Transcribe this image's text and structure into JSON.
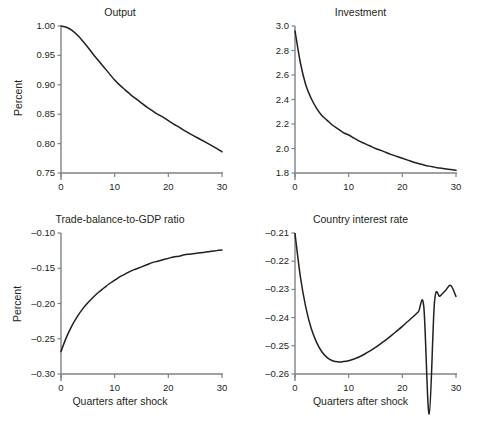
{
  "figure": {
    "background": "#ffffff",
    "axis_color": "#808285",
    "curve_color": "#231f20",
    "text_color": "#231f20"
  },
  "chart_data": [
    {
      "type": "line",
      "panel": "top-left",
      "title": "Output",
      "xlabel": "",
      "ylabel": "Percent",
      "xlim": [
        0,
        30
      ],
      "ylim": [
        0.75,
        1.0
      ],
      "grid": false,
      "legend": "none",
      "xticks": [
        0,
        10,
        20,
        30
      ],
      "xtick_labels": [
        "0",
        "10",
        "20",
        "30"
      ],
      "yticks": [
        0.75,
        0.8,
        0.85,
        0.9,
        0.95,
        1.0
      ],
      "ytick_labels": [
        "0.75",
        "0.80",
        "0.85",
        "0.90",
        "0.95",
        "1.00"
      ],
      "x": [
        0,
        1,
        2,
        3,
        4,
        5,
        6,
        7,
        8,
        9,
        10,
        11,
        12,
        13,
        14,
        15,
        16,
        17,
        18,
        19,
        20,
        21,
        22,
        23,
        24,
        25,
        26,
        27,
        28,
        29,
        30
      ],
      "values": [
        1.0,
        0.998,
        0.993,
        0.985,
        0.975,
        0.964,
        0.952,
        0.941,
        0.93,
        0.919,
        0.908,
        0.899,
        0.891,
        0.883,
        0.876,
        0.869,
        0.862,
        0.856,
        0.85,
        0.845,
        0.839,
        0.833,
        0.828,
        0.822,
        0.817,
        0.812,
        0.807,
        0.802,
        0.797,
        0.792,
        0.786
      ]
    },
    {
      "type": "line",
      "panel": "top-right",
      "title": "Investment",
      "xlabel": "",
      "ylabel": "",
      "xlim": [
        0,
        30
      ],
      "ylim": [
        1.8,
        3.0
      ],
      "grid": false,
      "legend": "none",
      "xticks": [
        0,
        10,
        20,
        30
      ],
      "xtick_labels": [
        "0",
        "10",
        "20",
        "30"
      ],
      "yticks": [
        1.8,
        2.0,
        2.2,
        2.4,
        2.6,
        2.8,
        3.0
      ],
      "ytick_labels": [
        "1.8",
        "2.0",
        "2.2",
        "2.4",
        "2.6",
        "2.8",
        "3.0"
      ],
      "x": [
        0,
        1,
        2,
        3,
        4,
        5,
        6,
        7,
        8,
        9,
        10,
        11,
        12,
        13,
        14,
        15,
        16,
        17,
        18,
        19,
        20,
        21,
        22,
        23,
        24,
        25,
        26,
        27,
        28,
        29,
        30
      ],
      "values": [
        2.96,
        2.7,
        2.52,
        2.41,
        2.33,
        2.27,
        2.23,
        2.19,
        2.16,
        2.13,
        2.11,
        2.085,
        2.06,
        2.04,
        2.02,
        2.0,
        1.985,
        1.967,
        1.95,
        1.935,
        1.92,
        1.905,
        1.89,
        1.878,
        1.866,
        1.856,
        1.848,
        1.84,
        1.834,
        1.828,
        1.822
      ]
    },
    {
      "type": "line",
      "panel": "bottom-left",
      "title": "Trade-balance-to-GDP ratio",
      "xlabel": "Quarters after shock",
      "ylabel": "Percent",
      "xlim": [
        0,
        30
      ],
      "ylim": [
        -0.3,
        -0.1
      ],
      "grid": false,
      "legend": "none",
      "xticks": [
        0,
        10,
        20,
        30
      ],
      "xtick_labels": [
        "0",
        "10",
        "20",
        "30"
      ],
      "yticks": [
        -0.3,
        -0.25,
        -0.2,
        -0.15,
        -0.1
      ],
      "ytick_labels": [
        "–0.30",
        "–0.25",
        "–0.20",
        "–0.15",
        "–0.10"
      ],
      "x": [
        0,
        1,
        2,
        3,
        4,
        5,
        6,
        7,
        8,
        9,
        10,
        11,
        12,
        13,
        14,
        15,
        16,
        17,
        18,
        19,
        20,
        21,
        22,
        23,
        24,
        25,
        26,
        27,
        28,
        29,
        30
      ],
      "values": [
        -0.268,
        -0.248,
        -0.232,
        -0.219,
        -0.208,
        -0.199,
        -0.191,
        -0.184,
        -0.178,
        -0.172,
        -0.167,
        -0.162,
        -0.158,
        -0.154,
        -0.151,
        -0.148,
        -0.145,
        -0.142,
        -0.14,
        -0.138,
        -0.136,
        -0.134,
        -0.133,
        -0.131,
        -0.13,
        -0.129,
        -0.128,
        -0.127,
        -0.126,
        -0.125,
        -0.124
      ]
    },
    {
      "type": "line",
      "panel": "bottom-right",
      "title": "Country interest rate",
      "xlabel": "Quarters after shock",
      "ylabel": "",
      "xlim": [
        0,
        30
      ],
      "ylim": [
        -0.26,
        -0.21
      ],
      "grid": false,
      "legend": "none",
      "xticks": [
        0,
        10,
        20,
        30
      ],
      "xtick_labels": [
        "0",
        "10",
        "20",
        "30"
      ],
      "yticks": [
        -0.26,
        -0.25,
        -0.24,
        -0.23,
        -0.22,
        -0.21
      ],
      "ytick_labels": [
        "–0.26",
        "–0.25",
        "–0.24",
        "–0.23",
        "–0.22",
        "–0.21"
      ],
      "x": [
        0,
        1,
        2,
        3,
        4,
        5,
        6,
        7,
        8,
        9,
        10,
        11,
        12,
        13,
        14,
        15,
        16,
        17,
        18,
        19,
        20,
        21,
        22,
        23,
        24,
        25,
        26,
        27,
        28,
        29,
        30
      ],
      "values": [
        -0.2102,
        -0.2255,
        -0.2362,
        -0.2437,
        -0.2487,
        -0.2521,
        -0.2542,
        -0.2553,
        -0.2557,
        -0.2556,
        -0.2553,
        -0.2547,
        -0.2539,
        -0.2529,
        -0.2518,
        -0.2506,
        -0.2492,
        -0.2478,
        -0.2463,
        -0.2447,
        -0.2431,
        -0.2414,
        -0.2397,
        -0.2379,
        -0.2361,
        -0.2742,
        -0.2343,
        -0.2324,
        -0.2305,
        -0.2286,
        -0.2325
      ]
    }
  ]
}
